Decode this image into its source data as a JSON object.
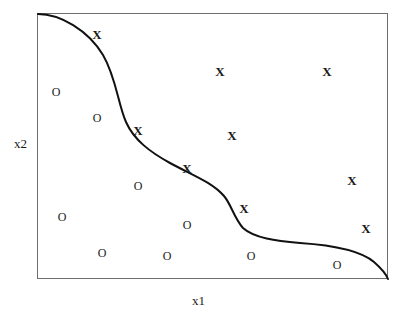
{
  "figure": {
    "title": "",
    "axes": {
      "x_label": "x1",
      "y_label": "x2"
    },
    "plot_box": {
      "left": 37,
      "top": 13,
      "width": 351,
      "height": 266,
      "border_color": "#6e6e6e"
    },
    "curve": {
      "name": "decision-boundary",
      "color": "#111111",
      "stroke_width": 2.0,
      "path": "M 38 14 C 60 14, 88 30, 103 55 C 116 77, 118 104, 126 122 C 134 140, 150 152, 170 163 C 192 175, 212 182, 224 196 C 231 204, 234 218, 243 228 C 254 238, 276 241, 300 243 C 330 245, 360 250, 374 262 C 382 269, 386 274, 388 279"
    }
  },
  "chart_data": {
    "type": "scatter",
    "title": "",
    "xlabel": "x1",
    "ylabel": "x2",
    "xlim": [
      0,
      1
    ],
    "ylim": [
      0,
      1
    ],
    "grid": false,
    "legend": "none",
    "annotations": [
      "Decision boundary curve separating X class (upper-right) from O class (lower-left)"
    ],
    "series": [
      {
        "name": "X",
        "marker": "X",
        "count": 8,
        "points": [
          {
            "label": "X",
            "px": 97,
            "py": 34,
            "x": 0.17,
            "y": 0.93
          },
          {
            "label": "X",
            "px": 220,
            "py": 71,
            "x": 0.52,
            "y": 0.79
          },
          {
            "label": "X",
            "px": 327,
            "py": 71,
            "x": 0.83,
            "y": 0.79
          },
          {
            "label": "X",
            "px": 138,
            "py": 130,
            "x": 0.29,
            "y": 0.57
          },
          {
            "label": "X",
            "px": 232,
            "py": 135,
            "x": 0.56,
            "y": 0.55
          },
          {
            "label": "X",
            "px": 187,
            "py": 168,
            "x": 0.43,
            "y": 0.42
          },
          {
            "label": "X",
            "px": 352,
            "py": 180,
            "x": 0.9,
            "y": 0.38
          },
          {
            "label": "X",
            "px": 244,
            "py": 208,
            "x": 0.59,
            "y": 0.28
          },
          {
            "label": "X",
            "px": 366,
            "py": 228,
            "x": 0.94,
            "y": 0.2
          }
        ]
      },
      {
        "name": "O",
        "marker": "O",
        "count": 9,
        "points": [
          {
            "label": "O",
            "px": 56,
            "py": 92,
            "x": 0.05,
            "y": 0.71
          },
          {
            "label": "O",
            "px": 97,
            "py": 118,
            "x": 0.17,
            "y": 0.61
          },
          {
            "label": "O",
            "px": 138,
            "py": 186,
            "x": 0.29,
            "y": 0.36
          },
          {
            "label": "O",
            "px": 62,
            "py": 217,
            "x": 0.07,
            "y": 0.24
          },
          {
            "label": "O",
            "px": 187,
            "py": 225,
            "x": 0.43,
            "y": 0.21
          },
          {
            "label": "O",
            "px": 102,
            "py": 253,
            "x": 0.19,
            "y": 0.1
          },
          {
            "label": "O",
            "px": 167,
            "py": 256,
            "x": 0.37,
            "y": 0.09
          },
          {
            "label": "O",
            "px": 251,
            "py": 256,
            "x": 0.61,
            "y": 0.09
          },
          {
            "label": "O",
            "px": 337,
            "py": 265,
            "x": 0.86,
            "y": 0.05
          }
        ]
      }
    ]
  },
  "colors": {
    "background": "#ffffff",
    "ink": "#1a1a1a",
    "curve": "#111111",
    "frame": "#6e6e6e"
  }
}
